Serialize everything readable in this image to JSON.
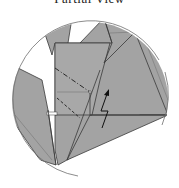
{
  "diagram": {
    "title": "Partial View",
    "title_cropped": true,
    "type": "origami-fold-detail",
    "colors": {
      "paper": "#a3a3a3",
      "paper_light": "#b2b2b2",
      "line": "#3a3a3a",
      "outline": "#6e6e6e",
      "background": "#ffffff"
    },
    "elements": {
      "view_circle": "circular detail view",
      "mountain_fold": "dash-dot fold line",
      "valley_fold": "dashed fold line",
      "arrow": "zigzag push/sink arrow"
    }
  }
}
